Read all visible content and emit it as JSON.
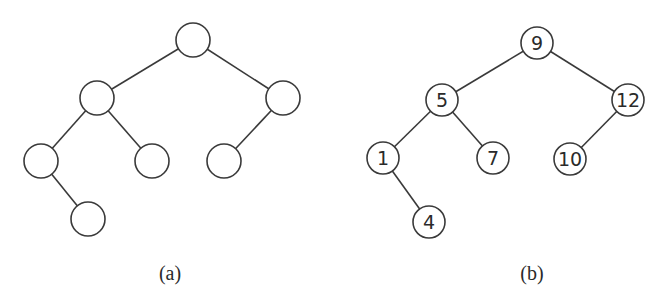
{
  "figure": {
    "trees": [
      {
        "id": "a",
        "caption": "(a)",
        "caption_pos": [
          170,
          280
        ],
        "radius": 17,
        "nodes": [
          {
            "id": "a0",
            "key": "",
            "x": 193,
            "y": 40
          },
          {
            "id": "a1",
            "key": "",
            "x": 97,
            "y": 98
          },
          {
            "id": "a2",
            "key": "",
            "x": 283,
            "y": 98
          },
          {
            "id": "a3",
            "key": "",
            "x": 41,
            "y": 161
          },
          {
            "id": "a4",
            "key": "",
            "x": 152,
            "y": 161
          },
          {
            "id": "a5",
            "key": "",
            "x": 224,
            "y": 161
          },
          {
            "id": "a6",
            "key": "",
            "x": 88,
            "y": 219
          }
        ],
        "edges": [
          [
            "a0",
            "a1"
          ],
          [
            "a0",
            "a2"
          ],
          [
            "a1",
            "a3"
          ],
          [
            "a1",
            "a4"
          ],
          [
            "a2",
            "a5"
          ],
          [
            "a3",
            "a6"
          ]
        ]
      },
      {
        "id": "b",
        "caption": "(b)",
        "caption_pos": [
          532,
          280
        ],
        "radius": 16,
        "nodes": [
          {
            "id": "b0",
            "key": "9",
            "x": 537,
            "y": 43
          },
          {
            "id": "b1",
            "key": "5",
            "x": 442,
            "y": 100
          },
          {
            "id": "b2",
            "key": "12",
            "x": 628,
            "y": 100
          },
          {
            "id": "b3",
            "key": "1",
            "x": 383,
            "y": 158
          },
          {
            "id": "b4",
            "key": "7",
            "x": 493,
            "y": 158
          },
          {
            "id": "b5",
            "key": "10",
            "x": 570,
            "y": 159
          },
          {
            "id": "b6",
            "key": "4",
            "x": 429,
            "y": 222
          }
        ],
        "edges": [
          [
            "b0",
            "b1"
          ],
          [
            "b0",
            "b2"
          ],
          [
            "b1",
            "b3"
          ],
          [
            "b1",
            "b4"
          ],
          [
            "b2",
            "b5"
          ],
          [
            "b3",
            "b6"
          ]
        ]
      }
    ]
  }
}
